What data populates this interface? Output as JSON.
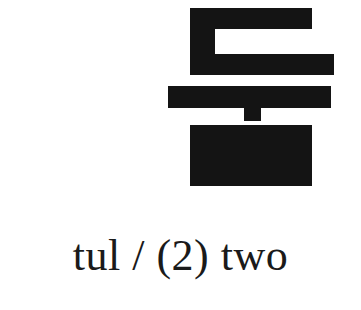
{
  "card": {
    "background_color": "#ffffff",
    "ink_color": "#141414"
  },
  "glyph": {
    "name": "hangul-syllable",
    "syllable": "둘",
    "romanization": "tul",
    "components": [
      {
        "jamo": "ㄷ",
        "name": "digeut",
        "role": "initial-consonant"
      },
      {
        "jamo": "ㅜ",
        "name": "u",
        "role": "vowel"
      },
      {
        "jamo": "ㄹ",
        "name": "rieul",
        "role": "final-consonant"
      }
    ]
  },
  "caption": {
    "text": "tul / (2) two",
    "romanization": "tul",
    "separator": "/",
    "number": "(2)",
    "meaning": "two",
    "color": "#1a1a1a"
  }
}
